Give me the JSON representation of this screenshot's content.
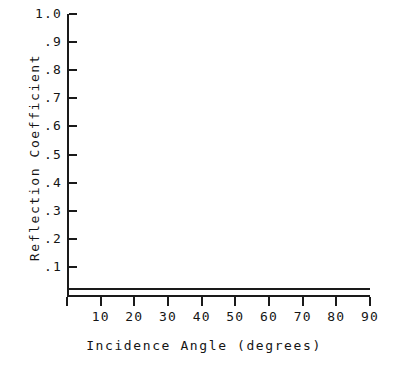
{
  "chart_data": {
    "type": "line",
    "title": "",
    "xlabel": "Incidence Angle (degrees)",
    "ylabel": "Reflection Coefficient",
    "xlim": [
      0,
      90
    ],
    "ylim": [
      0,
      1.0
    ],
    "grid": false,
    "legend": null,
    "x_ticks": [
      0,
      10,
      20,
      30,
      40,
      50,
      60,
      70,
      80,
      90
    ],
    "x_ticklabels": [
      "",
      "10",
      "20",
      "30",
      "40",
      "50",
      "60",
      "70",
      "80",
      "90"
    ],
    "y_ticks": [
      0.1,
      0.2,
      0.3,
      0.4,
      0.5,
      0.6,
      0.7,
      0.8,
      0.9,
      1.0
    ],
    "y_ticklabels": [
      ".1",
      ".2",
      ".3",
      ".4",
      ".5",
      ".6",
      ".7",
      ".8",
      ".9",
      "1.0"
    ],
    "series": [
      {
        "name": "reflection-coefficient",
        "color": "#1a1a1a",
        "x": [
          0,
          10,
          20,
          30,
          40,
          50,
          60,
          70,
          80,
          90
        ],
        "values": [
          0.02,
          0.02,
          0.02,
          0.02,
          0.02,
          0.02,
          0.02,
          0.02,
          0.02,
          0.02
        ]
      }
    ]
  }
}
